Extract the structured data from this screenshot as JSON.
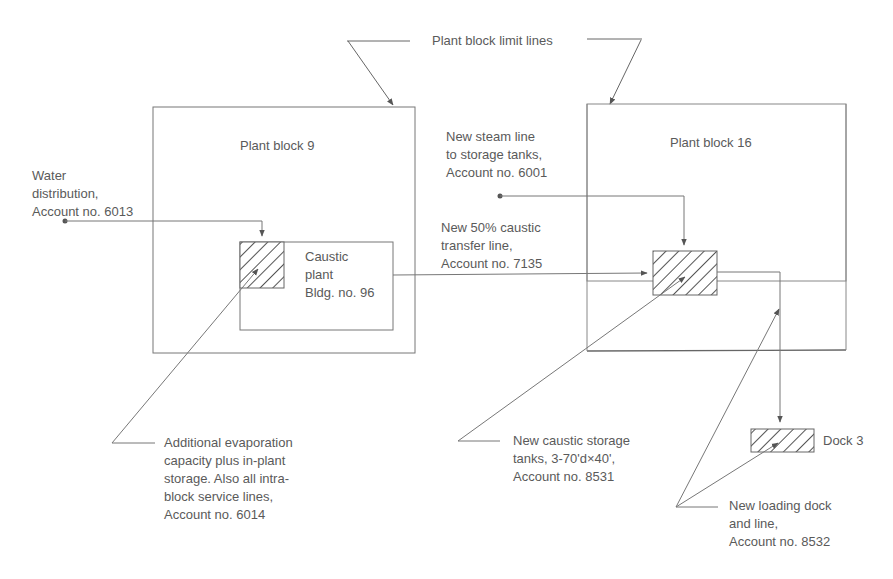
{
  "diagram": {
    "title_callout": "Plant block limit lines",
    "blocks": {
      "block9": "Plant block 9",
      "block16": "Plant block 16"
    },
    "caustic_plant": [
      "Caustic",
      "plant",
      "Bldg. no. 96"
    ],
    "dock": "Dock 3",
    "annotations": {
      "water": [
        "Water",
        "distribution,",
        "Account no. 6013"
      ],
      "steam": [
        "New steam line",
        "to storage tanks,",
        "Account no. 6001"
      ],
      "transfer": [
        "New 50% caustic",
        "transfer line,",
        "Account no. 7135"
      ],
      "evaporation": [
        "Additional evaporation",
        "capacity plus in-plant",
        "storage. Also all intra-",
        "block service lines,",
        "Account no. 6014"
      ],
      "storage": [
        "New caustic storage",
        "tanks, 3-70'd×40',",
        "Account no. 8531"
      ],
      "loading": [
        "New loading dock",
        "and line,",
        "Account no. 8532"
      ]
    }
  }
}
